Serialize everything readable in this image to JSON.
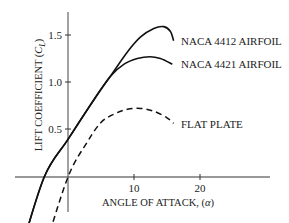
{
  "chart_data": {
    "type": "line",
    "title": "",
    "xlabel": "ANGLE OF ATTACK, (α)",
    "ylabel": "LIFT COEFFICIENT (C_L)",
    "ylabel_main": "LIFT COEFFICIENT (",
    "ylabel_sym": "C",
    "ylabel_sub": "L",
    "ylabel_end": ")",
    "xlabel_main": "ANGLE OF ATTACK, (",
    "xlabel_sym": "α",
    "xlabel_end": ")",
    "x_ticks": [
      "10",
      "20"
    ],
    "y_ticks": [
      "0.5",
      "1.0",
      "1.5"
    ],
    "xlim": [
      -8,
      31
    ],
    "ylim": [
      -0.75,
      1.75
    ],
    "grid": false,
    "legend_position": "inline labels at right end of curves",
    "series": [
      {
        "name": "NACA 4412 AIRFOIL",
        "style": "solid",
        "points": [
          [
            -7.2,
            -0.8
          ],
          [
            -3.6,
            0.0
          ],
          [
            0,
            0.4
          ],
          [
            4,
            0.83
          ],
          [
            6.4,
            1.07
          ],
          [
            9,
            1.33
          ],
          [
            11,
            1.49
          ],
          [
            13,
            1.58
          ],
          [
            14.5,
            1.6
          ],
          [
            15.5,
            1.55
          ],
          [
            16,
            1.45
          ]
        ]
      },
      {
        "name": "NACA 4421 AIRFOIL",
        "style": "solid",
        "points": [
          [
            -7.2,
            -0.8
          ],
          [
            -3.6,
            0.0
          ],
          [
            0,
            0.4
          ],
          [
            4,
            0.83
          ],
          [
            6.4,
            1.07
          ],
          [
            8.5,
            1.2
          ],
          [
            10.5,
            1.26
          ],
          [
            12.4,
            1.28
          ],
          [
            14,
            1.26
          ],
          [
            15.8,
            1.2
          ]
        ]
      },
      {
        "name": "FLAT PLATE",
        "style": "dashed",
        "points": [
          [
            -3.6,
            -0.78
          ],
          [
            0,
            0.0
          ],
          [
            3,
            0.38
          ],
          [
            5,
            0.58
          ],
          [
            7,
            0.67
          ],
          [
            9,
            0.72
          ],
          [
            11,
            0.73
          ],
          [
            13,
            0.7
          ],
          [
            15,
            0.63
          ],
          [
            16,
            0.57
          ]
        ]
      }
    ],
    "legend": [
      "NACA 4412 AIRFOIL",
      "NACA 4421 AIRFOIL",
      "FLAT PLATE"
    ]
  }
}
